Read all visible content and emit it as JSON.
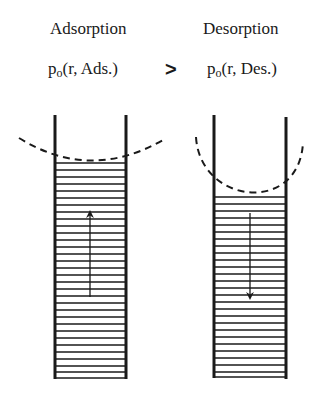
{
  "left_panel": {
    "title": "Adsorption",
    "formula_p": "p",
    "formula_sub": "o",
    "formula_rest": "(r, Ads.)",
    "arrow_direction": "up"
  },
  "comparison": {
    "symbol": ">"
  },
  "right_panel": {
    "title": "Desorption",
    "formula_p": "p",
    "formula_sub": "o",
    "formula_rest": "(r, Des.)",
    "arrow_direction": "down"
  },
  "colors": {
    "ink": "#1a1a1a",
    "background": "#ffffff"
  }
}
